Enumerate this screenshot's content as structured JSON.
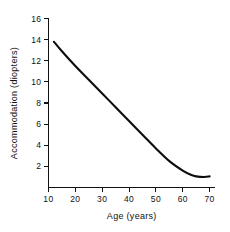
{
  "chart_data": {
    "type": "line",
    "title": "",
    "xlabel": "Age (years)",
    "ylabel": "Accommodation (diopters)",
    "xlim": [
      10,
      72
    ],
    "ylim": [
      0,
      16
    ],
    "xticks": [
      10,
      20,
      30,
      40,
      50,
      60,
      70
    ],
    "yticks": [
      2,
      4,
      6,
      8,
      10,
      12,
      14,
      16
    ],
    "xticklabels": [
      "10",
      "20",
      "30",
      "40",
      "50",
      "60",
      "70"
    ],
    "yticklabels": [
      "2",
      "4",
      "6",
      "8",
      "10",
      "12",
      "14",
      "16"
    ],
    "grid": false,
    "legend": false,
    "line_color": "#0d0d0d",
    "axis_color": "#111111",
    "background": "#ffffff",
    "series": [
      {
        "name": "Accommodation amplitude",
        "x": [
          12,
          15,
          20,
          25,
          30,
          35,
          40,
          45,
          50,
          55,
          60,
          63,
          65,
          68,
          70
        ],
        "values": [
          13.8,
          12.9,
          11.5,
          10.2,
          8.9,
          7.6,
          6.3,
          5.0,
          3.7,
          2.5,
          1.6,
          1.2,
          1.05,
          1.0,
          1.05
        ]
      }
    ]
  }
}
